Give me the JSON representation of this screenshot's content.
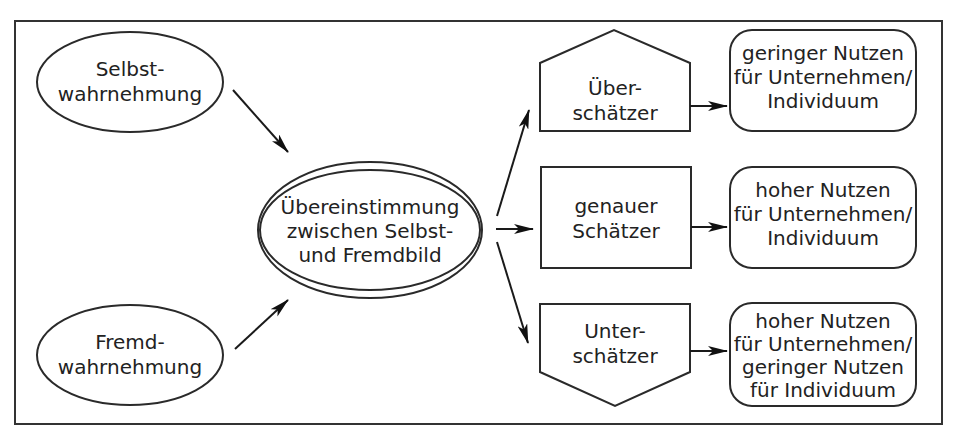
{
  "diagram": {
    "nodes": {
      "selbst": {
        "lines": [
          "Selbst-",
          "wahrnehmung"
        ],
        "shape": "ellipse"
      },
      "fremd": {
        "lines": [
          "Fremd-",
          "wahrnehmung"
        ],
        "shape": "ellipse"
      },
      "center": {
        "lines": [
          "Übereinstimmung",
          "zwischen Selbst-",
          "und Fremdbild"
        ],
        "shape": "double-ellipse"
      },
      "ueber": {
        "lines": [
          "Über-",
          "schätzer"
        ],
        "shape": "pentagon-up"
      },
      "genau": {
        "lines": [
          "genauer",
          "Schätzer"
        ],
        "shape": "rectangle"
      },
      "unter": {
        "lines": [
          "Unter-",
          "schätzer"
        ],
        "shape": "pentagon-down"
      },
      "out1": {
        "lines": [
          "geringer Nutzen",
          "für Unternehmen/",
          "Individuum"
        ],
        "shape": "rounded-rectangle"
      },
      "out2": {
        "lines": [
          "hoher Nutzen",
          "für Unternehmen/",
          "Individuum"
        ],
        "shape": "rounded-rectangle"
      },
      "out3": {
        "lines": [
          "hoher Nutzen",
          "für Unternehmen/",
          "geringer Nutzen",
          "für Individuum"
        ],
        "shape": "rounded-rectangle"
      }
    },
    "edges": [
      {
        "from": "selbst",
        "to": "center"
      },
      {
        "from": "fremd",
        "to": "center"
      },
      {
        "from": "center",
        "to": "ueber"
      },
      {
        "from": "center",
        "to": "genau"
      },
      {
        "from": "center",
        "to": "unter"
      },
      {
        "from": "ueber",
        "to": "out1"
      },
      {
        "from": "genau",
        "to": "out2"
      },
      {
        "from": "unter",
        "to": "out3"
      }
    ]
  }
}
